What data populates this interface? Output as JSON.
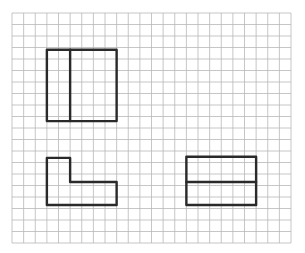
{
  "diagram": {
    "type": "grid-paper-shapes",
    "background": "#ffffff",
    "grid": {
      "origin_x": 12,
      "origin_y": 13,
      "cell_w": 11.625,
      "cell_h": 11.5,
      "cols": 24,
      "rows": 20,
      "line_color": "#b8b8b8",
      "line_width": 0.8
    },
    "stroke": {
      "color": "#2a2a2a",
      "width": 2.4
    },
    "shapes": [
      {
        "id": "rect-split-vertical",
        "description": "Rectangle 6 cols x 6 rows divided by a vertical line after 2 cols",
        "outline": [
          [
            3,
            3.2
          ],
          [
            9,
            3.2
          ],
          [
            9,
            9.4
          ],
          [
            3,
            9.4
          ]
        ],
        "dividers": [
          [
            [
              5,
              3.2
            ],
            [
              5,
              9.4
            ]
          ]
        ]
      },
      {
        "id": "l-shape",
        "description": "L-shaped figure: 2 cols wide upper part, 6 cols wide base, 4 rows total",
        "outline": [
          [
            3,
            12.6
          ],
          [
            5,
            12.6
          ],
          [
            5,
            14.7
          ],
          [
            9,
            14.7
          ],
          [
            9,
            16.7
          ],
          [
            3,
            16.7
          ]
        ],
        "dividers": []
      },
      {
        "id": "rect-split-horizontal",
        "description": "Rectangle 6 cols x 4 rows divided by a horizontal line at the middle",
        "outline": [
          [
            15,
            12.5
          ],
          [
            21,
            12.5
          ],
          [
            21,
            16.7
          ],
          [
            15,
            16.7
          ]
        ],
        "dividers": [
          [
            [
              15,
              14.7
            ],
            [
              21,
              14.7
            ]
          ]
        ]
      }
    ]
  }
}
